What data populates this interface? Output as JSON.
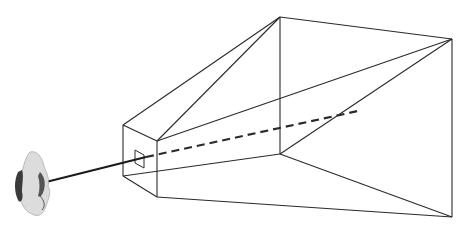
{
  "diagram": {
    "type": "view-frustum",
    "elements": [
      {
        "name": "viewer-head",
        "kind": "image"
      },
      {
        "name": "sight-ray",
        "kind": "solid-line"
      },
      {
        "name": "near-plane",
        "kind": "rectangle"
      },
      {
        "name": "viewport-window",
        "kind": "small-rectangle"
      },
      {
        "name": "far-plane",
        "kind": "rectangle"
      },
      {
        "name": "view-axis",
        "kind": "dashed-line"
      }
    ],
    "colors": {
      "line": "#2a2a2a",
      "background": "#ffffff",
      "head_light": "#d8d8d8",
      "head_dark": "#3a3a3a"
    }
  }
}
